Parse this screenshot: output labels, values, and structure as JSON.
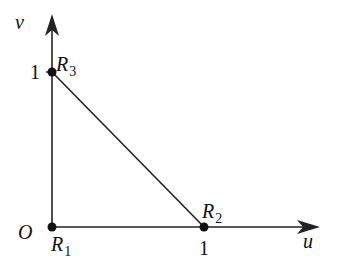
{
  "diagram": {
    "axes": {
      "x_label": "u",
      "y_label": "v",
      "origin_label": "O",
      "x_tick": "1",
      "y_tick": "1"
    },
    "points": [
      {
        "name": "R",
        "sub": "1",
        "coords": [
          0,
          0
        ]
      },
      {
        "name": "R",
        "sub": "2",
        "coords": [
          1,
          0
        ]
      },
      {
        "name": "R",
        "sub": "3",
        "coords": [
          0,
          1
        ]
      }
    ],
    "colors": {
      "stroke": "#222222"
    }
  }
}
